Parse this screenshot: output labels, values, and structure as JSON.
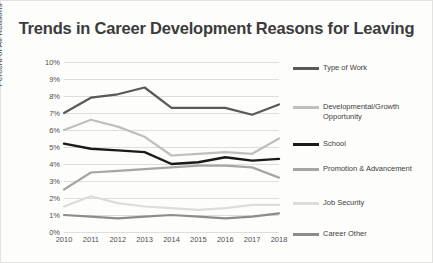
{
  "chart_data": {
    "type": "line",
    "title": "Trends in Career Development Reasons for Leaving",
    "xlabel": "",
    "ylabel": "Percent of All Reasons",
    "categories": [
      "2010",
      "2011",
      "2012",
      "2013",
      "2014",
      "2015",
      "2016",
      "2017",
      "2018"
    ],
    "x": [
      2010,
      2011,
      2012,
      2013,
      2014,
      2015,
      2016,
      2017,
      2018
    ],
    "ylim": [
      0,
      10
    ],
    "ytick_labels": [
      "0%",
      "1%",
      "2%",
      "3%",
      "4%",
      "5%",
      "6%",
      "7%",
      "8%",
      "9%",
      "10%"
    ],
    "ytick_values": [
      0,
      1,
      2,
      3,
      4,
      5,
      6,
      7,
      8,
      9,
      10
    ],
    "grid": true,
    "legend_position": "right",
    "series": [
      {
        "name": "Type of Work",
        "color": "#595959",
        "width": 2.2,
        "values": [
          7.0,
          7.9,
          8.1,
          8.5,
          7.3,
          7.3,
          7.3,
          6.9,
          7.5
        ]
      },
      {
        "name": "Developmental/Growth Opportunity",
        "color": "#bfbfbf",
        "width": 2.2,
        "values": [
          6.0,
          6.6,
          6.2,
          5.6,
          4.5,
          4.6,
          4.7,
          4.6,
          5.5
        ]
      },
      {
        "name": "School",
        "color": "#1a1a1a",
        "width": 2.4,
        "values": [
          5.2,
          4.9,
          4.8,
          4.7,
          4.0,
          4.1,
          4.4,
          4.2,
          4.3
        ]
      },
      {
        "name": "Promotion & Advancement",
        "color": "#a6a6a6",
        "width": 2.2,
        "values": [
          2.5,
          3.5,
          3.6,
          3.7,
          3.8,
          3.9,
          3.9,
          3.8,
          3.2
        ]
      },
      {
        "name": "Job Security",
        "color": "#dcdcdc",
        "width": 2.2,
        "values": [
          1.5,
          2.1,
          1.7,
          1.5,
          1.4,
          1.3,
          1.4,
          1.6,
          1.6
        ]
      },
      {
        "name": "Career Other",
        "color": "#8c8c8c",
        "width": 2.2,
        "values": [
          1.0,
          0.9,
          0.8,
          0.9,
          1.0,
          0.9,
          0.8,
          0.9,
          1.1
        ]
      }
    ]
  }
}
